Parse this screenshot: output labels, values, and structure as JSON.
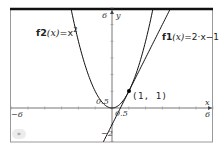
{
  "chart_data": {
    "type": "line",
    "title": "",
    "xlabel": "x",
    "ylabel": "y",
    "xlim": [
      -6,
      6
    ],
    "ylim": [
      -2,
      6
    ],
    "grid": false,
    "series": [
      {
        "name": "f1(x)=2·x-1",
        "expr": "2*x-1",
        "color": "#000000"
      },
      {
        "name": "f2(x)=x^2",
        "expr": "x^2",
        "color": "#000000"
      }
    ],
    "annotations": [
      {
        "type": "point",
        "x": 1,
        "y": 1,
        "label": "(1, 1)"
      }
    ],
    "tick_labels": {
      "x_min": "-6",
      "x_max": "6",
      "y_max": "6",
      "y_min": "-2",
      "x_small": "0.5",
      "y_small": "0.5"
    }
  },
  "labels": {
    "f1_name": "f1",
    "f1_arg": "(x)",
    "f1_rhs": "=2·x−1",
    "f2_name": "f2",
    "f2_arg": "(x)",
    "f2_rhs": "=x",
    "f2_exp": "2",
    "point": "(1, 1)",
    "x_axis": "x",
    "y_axis": "y",
    "x_min": "−6",
    "x_max": "6",
    "y_max": "6",
    "y_min": "−2",
    "half_x": "0.5",
    "half_y": "0.5",
    "menu_icon": "»"
  }
}
